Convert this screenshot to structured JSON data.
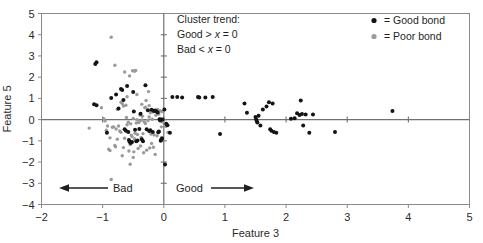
{
  "chart_data": {
    "type": "scatter",
    "title": "",
    "xlabel": "Feature 3",
    "ylabel": "Feature 5",
    "xlim": [
      -2,
      5
    ],
    "ylim": [
      -4,
      5
    ],
    "xticks": [
      -2,
      -1,
      0,
      1,
      2,
      3,
      4,
      5
    ],
    "xtick_labels": [
      "-2",
      "-1",
      "0",
      "1",
      "2",
      "3",
      "4",
      "5"
    ],
    "yticks": [
      -4,
      -3,
      -2,
      -1,
      0,
      1,
      2,
      3,
      4,
      5
    ],
    "ytick_labels": [
      "-4",
      "-3",
      "-2",
      "-1",
      "0",
      "1",
      "2",
      "3",
      "4",
      "5"
    ],
    "grid": false,
    "zero_lines": {
      "x": 0,
      "y": 0
    },
    "legend_position": "top-right",
    "series": [
      {
        "name": "Good bond",
        "marker": "filled-circle",
        "color": "#141414",
        "points": [
          [
            -1.12,
            2.62
          ],
          [
            -1.1,
            2.7
          ],
          [
            -1.14,
            0.72
          ],
          [
            -1.1,
            0.68
          ],
          [
            -0.93,
            -0.62
          ],
          [
            -0.86,
            1.02
          ],
          [
            -0.78,
            1.18
          ],
          [
            -0.74,
            0.52
          ],
          [
            -0.7,
            1.44
          ],
          [
            -0.68,
            1.4
          ],
          [
            -0.66,
            0.92
          ],
          [
            -0.64,
            -0.46
          ],
          [
            -0.62,
            -0.52
          ],
          [
            -0.6,
            1.58
          ],
          [
            -0.58,
            -0.58
          ],
          [
            -0.57,
            -0.96
          ],
          [
            -0.56,
            -1.04
          ],
          [
            -0.54,
            -1.1
          ],
          [
            -0.52,
            -1.06
          ],
          [
            -0.5,
            1.3
          ],
          [
            -0.49,
            0.38
          ],
          [
            -0.47,
            -0.48
          ],
          [
            -0.45,
            -1.02
          ],
          [
            -0.43,
            -0.98
          ],
          [
            -0.4,
            -0.44
          ],
          [
            -0.38,
            0.28
          ],
          [
            -0.36,
            -0.92
          ],
          [
            -0.34,
            -1.02
          ],
          [
            -0.3,
            1.62
          ],
          [
            -0.28,
            -0.46
          ],
          [
            -0.26,
            0.44
          ],
          [
            -0.24,
            -0.54
          ],
          [
            -0.22,
            -0.5
          ],
          [
            -0.2,
            0.46
          ],
          [
            -0.18,
            -0.58
          ],
          [
            -0.16,
            0.4
          ],
          [
            -0.14,
            0.42
          ],
          [
            -0.12,
            0.38
          ],
          [
            -0.1,
            0.34
          ],
          [
            -0.09,
            -0.6
          ],
          [
            -0.08,
            -0.56
          ],
          [
            -0.07,
            0.02
          ],
          [
            -0.06,
            -0.04
          ],
          [
            -0.05,
            -1.0
          ],
          [
            -0.04,
            -0.94
          ],
          [
            -0.03,
            -0.88
          ],
          [
            -0.02,
            0.0
          ],
          [
            0.01,
            0.48
          ],
          [
            0.02,
            -2.12
          ],
          [
            0.04,
            -0.2
          ],
          [
            0.06,
            -0.26
          ],
          [
            0.1,
            -0.62
          ],
          [
            0.14,
            1.06
          ],
          [
            0.22,
            1.06
          ],
          [
            0.3,
            1.04
          ],
          [
            0.56,
            1.06
          ],
          [
            0.58,
            1.04
          ],
          [
            0.68,
            1.04
          ],
          [
            0.8,
            1.06
          ],
          [
            0.92,
            -0.68
          ],
          [
            1.32,
            0.76
          ],
          [
            1.36,
            0.32
          ],
          [
            1.5,
            0.12
          ],
          [
            1.51,
            0.02
          ],
          [
            1.52,
            -0.06
          ],
          [
            1.53,
            -0.14
          ],
          [
            1.55,
            0.18
          ],
          [
            1.58,
            -0.28
          ],
          [
            1.62,
            0.48
          ],
          [
            1.68,
            0.62
          ],
          [
            1.72,
            0.82
          ],
          [
            1.74,
            -0.46
          ],
          [
            1.76,
            -0.52
          ],
          [
            1.78,
            0.76
          ],
          [
            1.8,
            -0.58
          ],
          [
            1.84,
            -0.62
          ],
          [
            2.08,
            0.04
          ],
          [
            2.14,
            0.06
          ],
          [
            2.18,
            0.3
          ],
          [
            2.22,
            0.22
          ],
          [
            2.24,
            0.9
          ],
          [
            2.26,
            0.26
          ],
          [
            2.28,
            -0.28
          ],
          [
            2.32,
            0.24
          ],
          [
            2.38,
            -0.62
          ],
          [
            2.44,
            0.24
          ],
          [
            2.8,
            -0.58
          ],
          [
            3.74,
            0.4
          ]
        ]
      },
      {
        "name": "Poor bond",
        "marker": "filled-circle",
        "color": "#9a9a9a",
        "points": [
          [
            -0.86,
            3.88
          ],
          [
            -0.8,
            2.56
          ],
          [
            -1.22,
            -0.4
          ],
          [
            -1.02,
            0.56
          ],
          [
            -0.98,
            0.04
          ],
          [
            -0.96,
            -0.06
          ],
          [
            -0.94,
            -0.5
          ],
          [
            -0.92,
            -0.3
          ],
          [
            -0.9,
            -1.4
          ],
          [
            -0.88,
            -1.46
          ],
          [
            -0.86,
            -2.82
          ],
          [
            -0.84,
            -0.36
          ],
          [
            -0.82,
            -0.34
          ],
          [
            -0.8,
            -1.22
          ],
          [
            -0.79,
            -1.28
          ],
          [
            -0.78,
            -0.44
          ],
          [
            -0.76,
            0.48
          ],
          [
            -0.74,
            -0.3
          ],
          [
            -0.72,
            -0.54
          ],
          [
            -0.7,
            -0.6
          ],
          [
            -0.68,
            0.76
          ],
          [
            -0.66,
            -1.32
          ],
          [
            -0.64,
            2.24
          ],
          [
            -0.62,
            0.68
          ],
          [
            -0.61,
            0.1
          ],
          [
            -0.6,
            -0.24
          ],
          [
            -0.58,
            -0.12
          ],
          [
            -0.57,
            -1.48
          ],
          [
            -0.56,
            2.06
          ],
          [
            -0.55,
            -1.18
          ],
          [
            -0.54,
            -0.2
          ],
          [
            -0.53,
            -0.74
          ],
          [
            -0.52,
            -0.8
          ],
          [
            -0.51,
            2.3
          ],
          [
            -0.5,
            0.06
          ],
          [
            -0.49,
            -1.52
          ],
          [
            -0.48,
            2.28
          ],
          [
            -0.47,
            -0.64
          ],
          [
            -0.46,
            2.32
          ],
          [
            -0.45,
            -0.16
          ],
          [
            -0.44,
            0.0
          ],
          [
            -0.43,
            -0.7
          ],
          [
            -0.42,
            -1.36
          ],
          [
            -0.41,
            -0.14
          ],
          [
            -0.4,
            -0.08
          ],
          [
            -0.39,
            0.22
          ],
          [
            -0.38,
            -1.24
          ],
          [
            -0.36,
            -0.02
          ],
          [
            -0.35,
            0.16
          ],
          [
            -0.34,
            -0.66
          ],
          [
            -0.33,
            -1.56
          ],
          [
            -0.32,
            -0.1
          ],
          [
            -0.31,
            0.56
          ],
          [
            -0.3,
            -0.18
          ],
          [
            -0.29,
            0.9
          ],
          [
            -0.28,
            -1.44
          ],
          [
            -0.26,
            -0.04
          ],
          [
            -0.25,
            1.32
          ],
          [
            -0.24,
            0.12
          ],
          [
            -0.23,
            -1.34
          ],
          [
            -0.22,
            0.32
          ],
          [
            -0.21,
            -0.68
          ],
          [
            -0.2,
            -1.12
          ],
          [
            -0.19,
            0.02
          ],
          [
            -0.18,
            0.36
          ],
          [
            -0.17,
            -1.3
          ],
          [
            -0.16,
            -0.72
          ],
          [
            -0.15,
            0.46
          ],
          [
            -0.14,
            -1.64
          ],
          [
            -0.13,
            0.2
          ],
          [
            -0.12,
            0.44
          ],
          [
            -0.11,
            -0.76
          ],
          [
            -0.55,
            -2.1
          ],
          [
            -0.1,
            0.48
          ],
          [
            -0.08,
            0.26
          ],
          [
            -0.06,
            0.42
          ],
          [
            -0.05,
            0.06
          ],
          [
            -0.04,
            -0.34
          ],
          [
            -0.03,
            0.38
          ],
          [
            -0.02,
            -0.12
          ],
          [
            -0.01,
            0.4
          ],
          [
            0.0,
            -0.02
          ],
          [
            0.03,
            -0.32
          ],
          [
            0.07,
            -0.6
          ],
          [
            -0.7,
            0.82
          ],
          [
            -0.66,
            0.64
          ],
          [
            -0.6,
            1.08
          ],
          [
            -0.44,
            1.18
          ],
          [
            -0.36,
            0.72
          ],
          [
            -0.3,
            0.58
          ],
          [
            -0.24,
            0.66
          ],
          [
            -0.88,
            -0.86
          ],
          [
            -0.76,
            -0.92
          ],
          [
            -0.64,
            -0.88
          ],
          [
            -0.48,
            -0.9
          ],
          [
            -0.37,
            -0.84
          ],
          [
            -0.68,
            -1.7
          ],
          [
            -0.5,
            -1.78
          ]
        ]
      }
    ],
    "annotations": [
      {
        "name": "cluster-trend",
        "lines": [
          "Cluster trend:",
          "Good > x = 0",
          "Bad < x = 0"
        ]
      },
      {
        "name": "bad-region",
        "text": "Bad",
        "arrow": "left"
      },
      {
        "name": "good-region",
        "text": "Good",
        "arrow": "right"
      }
    ]
  },
  "annotation_box": {
    "line1": "Cluster trend:",
    "line2_prefix": "Good > ",
    "line2_var": "x",
    "line2_suffix": " = 0",
    "line3_prefix": "Bad < ",
    "line3_var": "x",
    "line3_suffix": " = 0"
  },
  "legend": {
    "entries": [
      {
        "label": "= Good bond",
        "color": "#141414"
      },
      {
        "label": "= Poor bond",
        "color": "#9a9a9a"
      }
    ]
  },
  "regions": {
    "bad_label": "Bad",
    "good_label": "Good"
  },
  "axes": {
    "x_title": "Feature 3",
    "y_title": "Feature 5"
  },
  "colors": {
    "good_bond": "#141414",
    "poor_bond": "#9a9a9a",
    "frame": "#808080",
    "axis_line": "#707070",
    "text": "#1f1f1f"
  }
}
